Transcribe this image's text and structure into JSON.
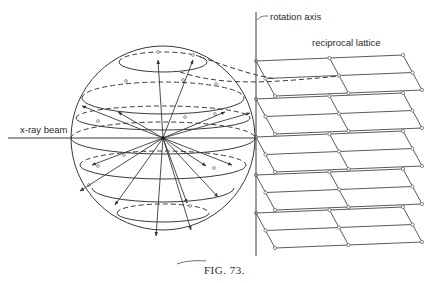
{
  "figure": {
    "caption": "Fig. 73.",
    "caption_text": "FIG. 73.",
    "labels": {
      "rotation_axis": "rotation axis",
      "reciprocal_lattice": "reciprocal lattice",
      "xray_beam": "x-ray beam"
    },
    "sphere": {
      "center": [
        163,
        138
      ],
      "radius": 92
    },
    "lattice_planes": {
      "count": 5,
      "spacing_px": 38,
      "cells_per_plane": "2 x 2"
    },
    "colors": {
      "ink": "#3a3a3a",
      "background": "#ffffff"
    }
  }
}
